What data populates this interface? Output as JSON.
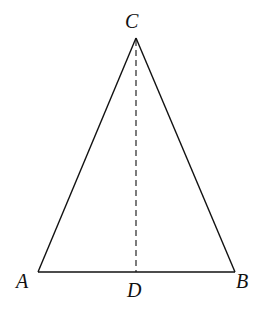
{
  "diagram": {
    "type": "isosceles-triangle-with-altitude",
    "vertices": {
      "A": {
        "label": "A",
        "x": 38,
        "y": 272
      },
      "B": {
        "label": "B",
        "x": 235,
        "y": 272
      },
      "C": {
        "label": "C",
        "x": 136,
        "y": 38
      },
      "D": {
        "label": "D",
        "x": 136,
        "y": 272
      }
    },
    "segments": [
      "AB",
      "AC",
      "BC"
    ],
    "dashed_segments": [
      "CD"
    ],
    "stroke_color": "#111111"
  }
}
